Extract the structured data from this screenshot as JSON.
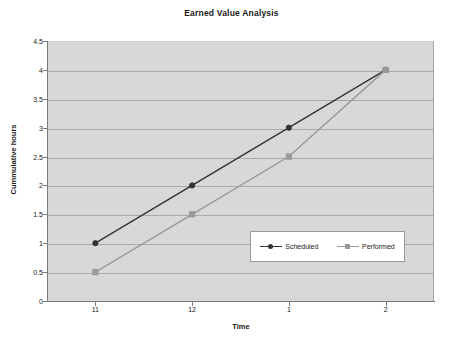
{
  "chart_data": {
    "type": "line",
    "title": "Earned Value Analysis",
    "xlabel": "Time",
    "ylabel": "Cummulative hours",
    "categories": [
      "11",
      "12",
      "1",
      "2"
    ],
    "series": [
      {
        "name": "Scheduled",
        "values": [
          1,
          2,
          3,
          4
        ],
        "color": "#333333",
        "marker": "diamond"
      },
      {
        "name": "Performed",
        "values": [
          0.5,
          1.5,
          2.5,
          4
        ],
        "color": "#999999",
        "marker": "square"
      }
    ],
    "ylim": [
      0,
      4.5
    ],
    "ytick_labels": [
      "0",
      "0.5",
      "1",
      "1.5",
      "2",
      "2.5",
      "3",
      "3.5",
      "4",
      "4.5"
    ],
    "ytick_values": [
      0,
      0.5,
      1,
      1.5,
      2,
      2.5,
      3,
      3.5,
      4,
      4.5
    ],
    "grid": true,
    "legend_position": "inside-center-right",
    "plot_background": "#d8d8d8",
    "gridline_color": "#a9a9a9",
    "axis_color": "#7a7a7a"
  }
}
